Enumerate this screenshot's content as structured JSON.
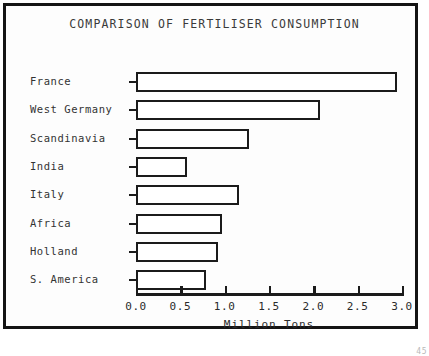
{
  "chart_data": {
    "type": "bar",
    "orientation": "horizontal",
    "title": "COMPARISON OF FERTILISER CONSUMPTION",
    "xlabel": "Million Tons",
    "ylabel": "",
    "categories": [
      "France",
      "West Germany",
      "Scandinavia",
      "India",
      "Italy",
      "Africa",
      "Holland",
      "S. America"
    ],
    "values": [
      2.94,
      2.08,
      1.28,
      0.58,
      1.16,
      0.97,
      0.92,
      0.79
    ],
    "xlim": [
      0.0,
      3.0
    ],
    "xticks": [
      "0.0",
      "0.5",
      "1.0",
      "1.5",
      "2.0",
      "2.5",
      "3.0"
    ],
    "xtick_values": [
      0.0,
      0.5,
      1.0,
      1.5,
      2.0,
      2.5,
      3.0
    ],
    "grid": false,
    "legend": false,
    "bar_fill": "#ffffff",
    "bar_edge": "#1b1b1b",
    "background": "#fdfdfd"
  },
  "figure": {
    "border_color": "#141414",
    "page_number": "45"
  }
}
